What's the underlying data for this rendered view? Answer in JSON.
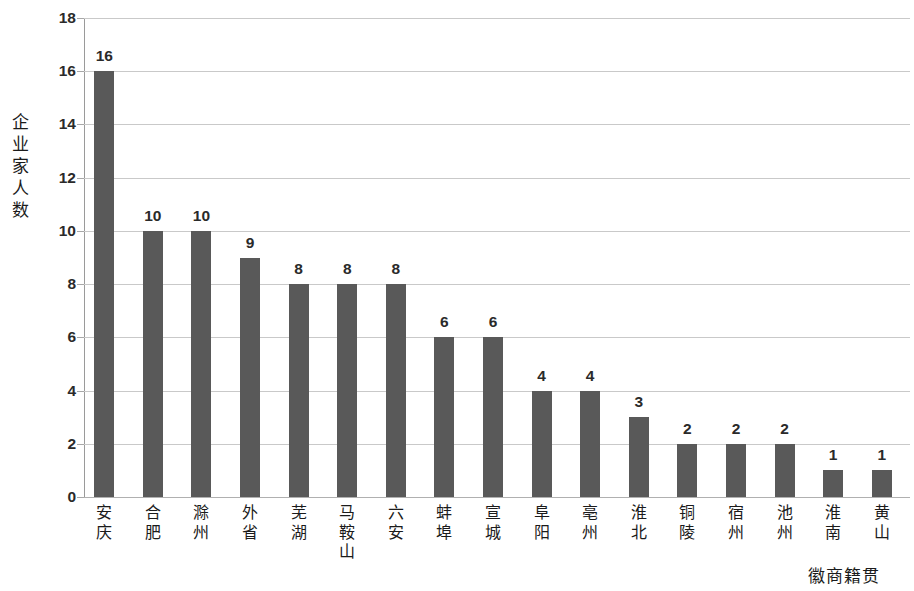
{
  "chart_data": {
    "type": "bar",
    "title": "",
    "xlabel": "徽商籍贯",
    "ylabel": "企业家人数",
    "ylim": [
      0,
      18
    ],
    "ytick_step": 2,
    "yticks": [
      18,
      16,
      14,
      12,
      10,
      8,
      6,
      4,
      2,
      0
    ],
    "grid": true,
    "legend": false,
    "orientation": "vertical",
    "bar_color": "#595959",
    "gridline_color": "#c9c9c9",
    "categories": [
      "安庆",
      "合肥",
      "滁州",
      "外省",
      "芜湖",
      "马鞍山",
      "六安",
      "蚌埠",
      "宣城",
      "阜阳",
      "亳州",
      "淮北",
      "铜陵",
      "宿州",
      "池州",
      "淮南",
      "黄山"
    ],
    "values": [
      16,
      10,
      10,
      9,
      8,
      8,
      8,
      6,
      6,
      4,
      4,
      3,
      2,
      2,
      2,
      1,
      1
    ],
    "data_labels": [
      "16",
      "10",
      "10",
      "9",
      "8",
      "8",
      "8",
      "6",
      "6",
      "4",
      "4",
      "3",
      "2",
      "2",
      "2",
      "1",
      "1"
    ]
  }
}
